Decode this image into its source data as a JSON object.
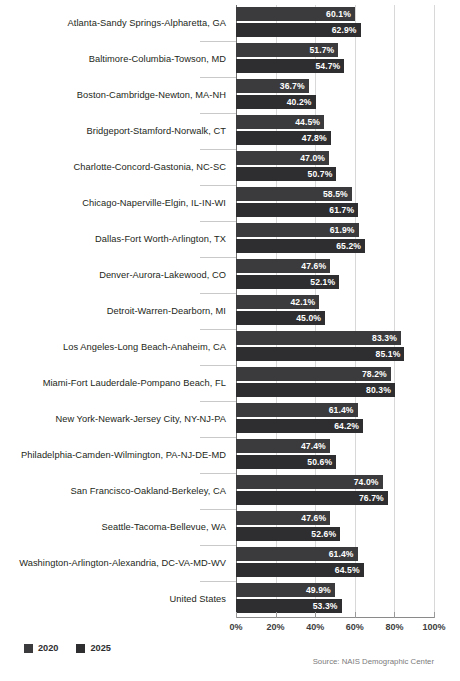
{
  "chart_data": {
    "type": "bar",
    "orientation": "horizontal",
    "title": "",
    "xlabel": "",
    "ylabel": "",
    "xlim": [
      0,
      100
    ],
    "xticks": [
      "0%",
      "20%",
      "40%",
      "60%",
      "80%",
      "100%"
    ],
    "xtick_values": [
      0,
      20,
      40,
      60,
      80,
      100
    ],
    "grid": true,
    "legend_position": "bottom-left",
    "value_suffix": "%",
    "categories": [
      "Atlanta-Sandy Springs-Alpharetta, GA",
      "Baltimore-Columbia-Towson, MD",
      "Boston-Cambridge-Newton, MA-NH",
      "Bridgeport-Stamford-Norwalk, CT",
      "Charlotte-Concord-Gastonia, NC-SC",
      "Chicago-Naperville-Elgin, IL-IN-WI",
      "Dallas-Fort Worth-Arlington, TX",
      "Denver-Aurora-Lakewood, CO",
      "Detroit-Warren-Dearborn, MI",
      "Los Angeles-Long Beach-Anaheim, CA",
      "Miami-Fort Lauderdale-Pompano Beach, FL",
      "New York-Newark-Jersey City, NY-NJ-PA",
      "Philadelphia-Camden-Wilmington, PA-NJ-DE-MD",
      "San Francisco-Oakland-Berkeley, CA",
      "Seattle-Tacoma-Bellevue, WA",
      "Washington-Arlington-Alexandria, DC-VA-MD-WV",
      "United States"
    ],
    "series": [
      {
        "name": "2020",
        "color": "#3b3b3d",
        "values": [
          60.1,
          51.7,
          36.7,
          44.5,
          47.0,
          58.5,
          61.9,
          47.6,
          42.1,
          83.3,
          78.2,
          61.4,
          47.4,
          74.0,
          47.6,
          61.4,
          49.9
        ],
        "labels": [
          "60.1%",
          "51.7%",
          "36.7%",
          "44.5%",
          "47.0%",
          "58.5%",
          "61.9%",
          "47.6%",
          "42.1%",
          "83.3%",
          "78.2%",
          "61.4%",
          "47.4%",
          "74.0%",
          "47.6%",
          "61.4%",
          "49.9%"
        ]
      },
      {
        "name": "2025",
        "color": "#2e2e30",
        "values": [
          62.9,
          54.7,
          40.2,
          47.8,
          50.7,
          61.7,
          65.2,
          52.1,
          45.0,
          85.1,
          80.3,
          64.2,
          50.6,
          76.7,
          52.6,
          64.5,
          53.3
        ],
        "labels": [
          "62.9%",
          "54.7%",
          "40.2%",
          "47.8%",
          "50.7%",
          "61.7%",
          "65.2%",
          "52.1%",
          "45.0%",
          "85.1%",
          "80.3%",
          "64.2%",
          "50.6%",
          "76.7%",
          "52.6%",
          "64.5%",
          "53.3%"
        ]
      }
    ]
  },
  "legend": {
    "items": [
      {
        "label": "2020",
        "color": "#3b3b3d"
      },
      {
        "label": "2025",
        "color": "#2e2e30"
      }
    ]
  },
  "footer": {
    "source": "Source: NAIS Demographic Center"
  },
  "header": {
    "clipped_title": ""
  }
}
